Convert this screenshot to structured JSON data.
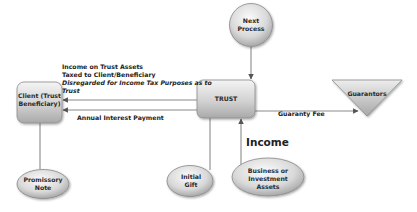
{
  "diagram": {
    "nodes": {
      "next_process": {
        "lines": [
          "Next",
          "Process"
        ],
        "shape": "circle"
      },
      "trust": {
        "lines": [
          "TRUST"
        ],
        "shape": "rounded-rectangle"
      },
      "client": {
        "lines": [
          "Client (Trust",
          "Beneficiary)"
        ],
        "shape": "rounded-rectangle"
      },
      "guarantors": {
        "lines": [
          "Guarantors"
        ],
        "shape": "inverted-triangle"
      },
      "promissory_note": {
        "lines": [
          "Promissory",
          "Note"
        ],
        "shape": "ellipse"
      },
      "initial_gift": {
        "lines": [
          "Initial",
          "Gift"
        ],
        "shape": "ellipse"
      },
      "business_assets": {
        "lines": [
          "Business or",
          "Investment",
          "Assets"
        ],
        "shape": "ellipse"
      }
    },
    "edges": [
      {
        "from": "next_process",
        "to": "trust",
        "label": ""
      },
      {
        "from": "trust",
        "to": "client",
        "label": "Income on Trust Assets"
      },
      {
        "from": "trust",
        "to": "client",
        "label": "Annual Interest Payment"
      },
      {
        "from": "trust",
        "to": "guarantors",
        "label": "Guaranty Fee"
      },
      {
        "from": "client",
        "to": "promissory_note",
        "label": ""
      },
      {
        "from": "trust",
        "to": "initial_gift",
        "label": ""
      },
      {
        "from": "business_assets",
        "to": "trust",
        "label": "Income"
      }
    ],
    "labels": {
      "income_line1": "Income on Trust Assets",
      "income_line2": "Taxed to Client/Beneficiary",
      "income_line3": "Disregarded for Income Tax Purposes as to",
      "income_line4": "Trust",
      "annual_interest": "Annual Interest Payment",
      "guaranty_fee": "Guaranty Fee",
      "income": "Income"
    }
  }
}
